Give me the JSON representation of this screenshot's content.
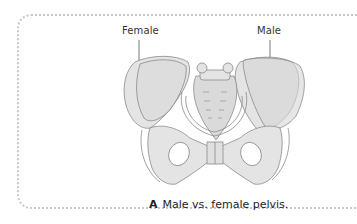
{
  "figure": {
    "labels": {
      "female": "Female",
      "male": "Male"
    },
    "caption": {
      "letter": "A",
      "text": "Male vs. female pelvis."
    },
    "colors": {
      "bone_fill": "#e4e4e4",
      "bone_fill_overlay": "#d6d6d6",
      "outline": "#8a8a8a",
      "border_dots": "#c9c9c9",
      "text": "#333333"
    }
  }
}
